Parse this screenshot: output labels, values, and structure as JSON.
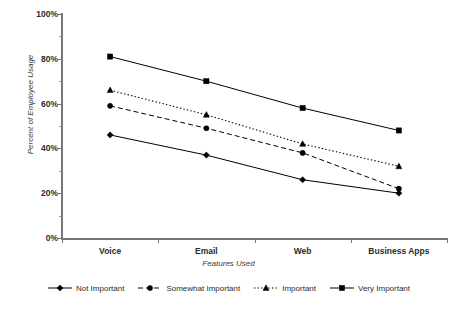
{
  "chart_data": {
    "type": "line",
    "title": "",
    "subtitle": "",
    "xlabel": "Features Used",
    "ylabel": "Percent of Employee Usage",
    "categories": [
      "Voice",
      "Email",
      "Web",
      "Business Apps"
    ],
    "ylim": [
      0,
      100
    ],
    "y_tick_labels": [
      "0%",
      "20%",
      "40%",
      "60%",
      "80%",
      "100%"
    ],
    "y_tick_values": [
      0,
      20,
      40,
      60,
      80,
      100
    ],
    "y_minor_tick_values": [
      10,
      30,
      50,
      70,
      90
    ],
    "grid": false,
    "legend_position": "bottom",
    "units": "percent",
    "series": [
      {
        "name": "Not Important",
        "values": [
          46,
          37,
          26,
          20
        ],
        "marker": "diamond",
        "line_style": "solid",
        "color": "#000000"
      },
      {
        "name": "Somewhat Important",
        "values": [
          59,
          49,
          38,
          22
        ],
        "marker": "circle",
        "line_style": "dashed",
        "color": "#000000"
      },
      {
        "name": "Important",
        "values": [
          66,
          55,
          42,
          32
        ],
        "marker": "triangle",
        "line_style": "dotted",
        "color": "#000000"
      },
      {
        "name": "Very Important",
        "values": [
          81,
          70,
          58,
          48
        ],
        "marker": "square",
        "line_style": "solid",
        "color": "#000000"
      }
    ]
  },
  "legend": {
    "items": [
      {
        "label": "Not Important",
        "marker": "diamond-marker",
        "line_style": "solid"
      },
      {
        "label": "Somewhat Important",
        "marker": "circle-marker",
        "line_style": "dashed"
      },
      {
        "label": "Important",
        "marker": "triangle-marker",
        "line_style": "dotted"
      },
      {
        "label": "Very Important",
        "marker": "square-marker",
        "line_style": "solid"
      }
    ]
  },
  "axis": {
    "y_title": "Percent of Employee Usage",
    "x_title": "Features Used"
  },
  "colors": {
    "axis": "#777777",
    "text": "#2c2c2c",
    "series": "#000000",
    "background": "#ffffff"
  }
}
